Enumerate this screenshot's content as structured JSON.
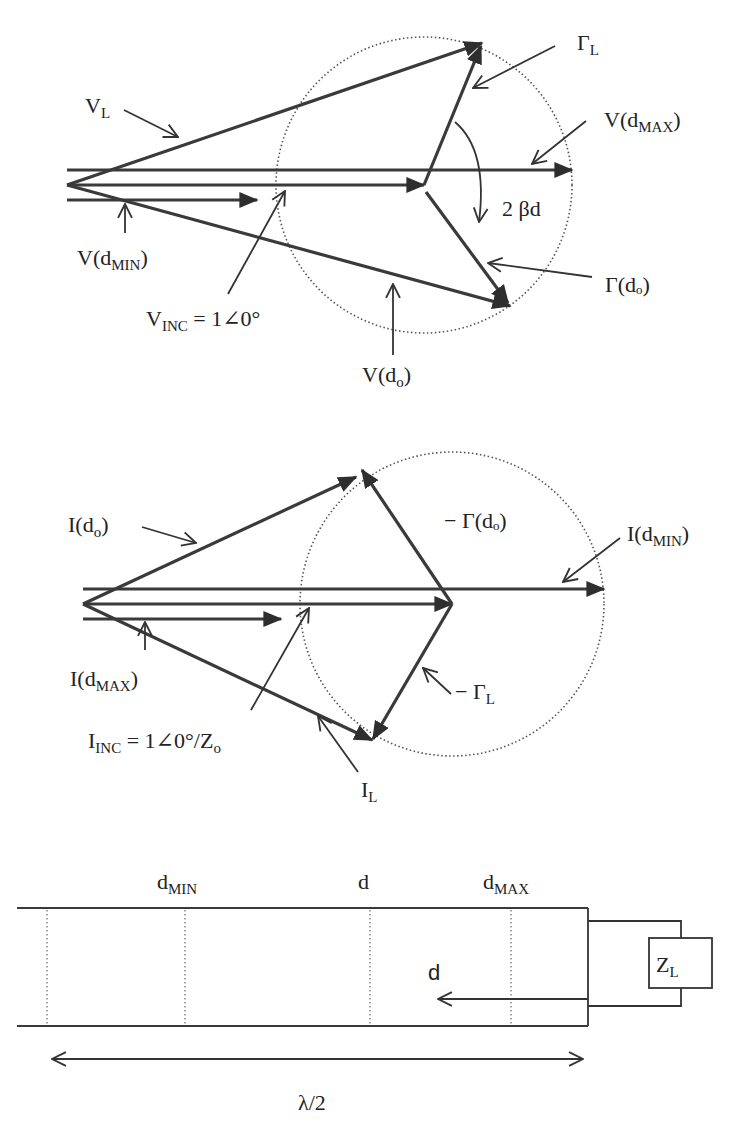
{
  "figure": {
    "voltage_phasor_diagram": {
      "labels": {
        "v_load": {
          "main": "V",
          "sub": "L"
        },
        "gamma_load": {
          "main": "Γ",
          "sub": "L"
        },
        "v_dmax": {
          "pre": "V(d",
          "sub": "MAX",
          "post": ")"
        },
        "angle": "2 βd",
        "gamma_do": "Γ(dₒ)",
        "v_dmin": {
          "pre": "V(d",
          "sub": "MIN",
          "post": ")"
        },
        "v_inc": {
          "main": "V",
          "sub": "INC",
          "post": " = 1∠0°"
        },
        "v_do": {
          "pre": "V(d",
          "sub": "o",
          "post": ")"
        }
      }
    },
    "current_phasor_diagram": {
      "labels": {
        "i_do": {
          "pre": "I(d",
          "sub": "o",
          "post": ")"
        },
        "neg_gamma_do": "− Γ(dₒ)",
        "i_dmin": {
          "pre": "I(d",
          "sub": "MIN",
          "post": ")"
        },
        "i_dmax": {
          "pre": "I(d",
          "sub": "MAX",
          "post": ")"
        },
        "neg_gamma_load": {
          "main": "− Γ",
          "sub": "L"
        },
        "i_inc": {
          "main": "I",
          "sub": "INC",
          "post": " = 1∠0°/Z",
          "post_sub": "o"
        },
        "i_load": {
          "main": "I",
          "sub": "L"
        }
      }
    },
    "transmission_line": {
      "labels": {
        "d_min": {
          "main": "d",
          "sub": "MIN"
        },
        "d": "d",
        "d_max": {
          "main": "d",
          "sub": "MAX"
        },
        "distance_arrow": "d",
        "load": {
          "main": "Z",
          "sub": "L"
        },
        "half_wavelength": "λ/2"
      }
    }
  }
}
